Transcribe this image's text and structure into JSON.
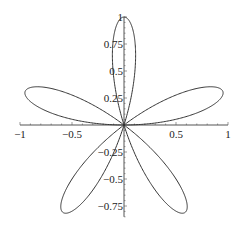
{
  "chart_data": {
    "type": "line",
    "title": "",
    "xlabel": "",
    "ylabel": "",
    "curve": "polar rose r = sin(5θ), θ ∈ [0, π]",
    "petals": 5,
    "xlim": [
      -1,
      1
    ],
    "ylim": [
      -0.85,
      1
    ],
    "x_ticks": [
      -1,
      -0.5,
      0.5,
      1
    ],
    "x_tick_labels": [
      "−1",
      "−0.5",
      "0.5",
      "1"
    ],
    "y_ticks": [
      1,
      0.75,
      0.5,
      0.25,
      -0.25,
      -0.5,
      -0.75
    ],
    "y_tick_labels": [
      "1",
      "0.75",
      "0.5",
      "0.25",
      "−0.25",
      "−0.5",
      "−0.75"
    ],
    "grid": false,
    "legend": null,
    "line_color": "#333333"
  }
}
